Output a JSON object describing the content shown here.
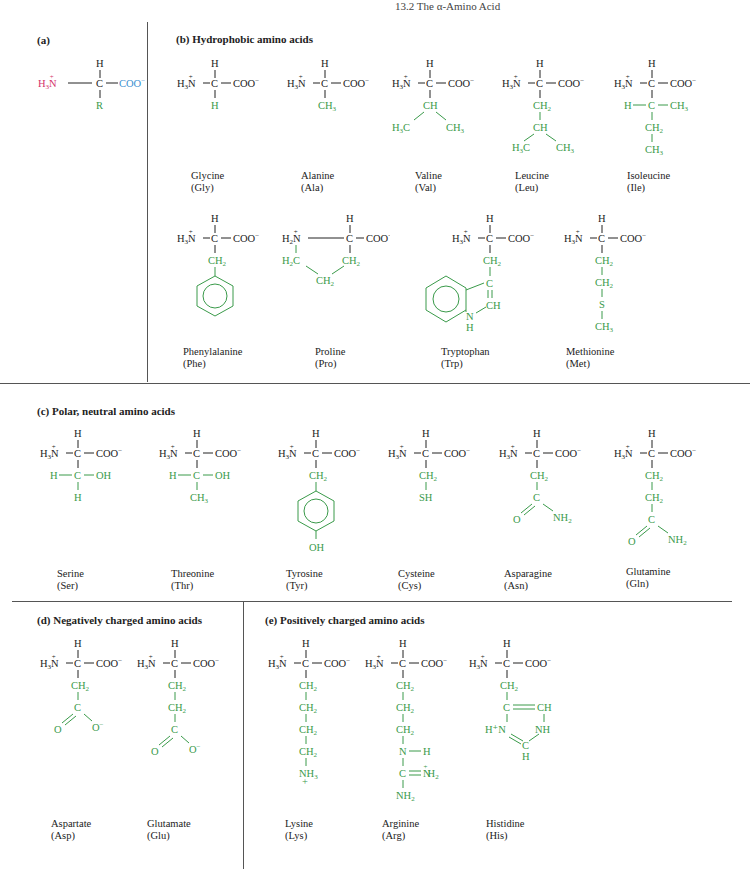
{
  "header": {
    "running_title": "13.2  The α-Amino Acid"
  },
  "sections": {
    "a": {
      "title": "(a)",
      "generic": {
        "amine": "H₃N̈⁺",
        "carbon": "C",
        "carboxyl": "COO⁻",
        "h": "H",
        "r": "R"
      }
    },
    "b": {
      "title": "(b) Hydrophobic amino acids"
    },
    "c": {
      "title": "(c) Polar, neutral amino acids"
    },
    "d": {
      "title": "(d) Negatively charged amino acids"
    },
    "e": {
      "title": "(e) Positively charged amino acids"
    }
  },
  "amino_acids": [
    {
      "name": "Glycine",
      "abbr": "(Gly)",
      "group": "b",
      "side_chain": "H"
    },
    {
      "name": "Alanine",
      "abbr": "(Ala)",
      "group": "b",
      "side_chain": "CH3"
    },
    {
      "name": "Valine",
      "abbr": "(Val)",
      "group": "b",
      "side_chain": "CH(CH3)2"
    },
    {
      "name": "Leucine",
      "abbr": "(Leu)",
      "group": "b",
      "side_chain": "CH2-CH(CH3)2"
    },
    {
      "name": "Isoleucine",
      "abbr": "(Ile)",
      "group": "b",
      "side_chain": "H-C-CH3, CH2, CH3"
    },
    {
      "name": "Phenylalanine",
      "abbr": "(Phe)",
      "group": "b",
      "side_chain": "CH2-phenyl"
    },
    {
      "name": "Proline",
      "abbr": "(Pro)",
      "group": "b",
      "side_chain": "H2C-CH2-CH2 ring"
    },
    {
      "name": "Tryptophan",
      "abbr": "(Trp)",
      "group": "b",
      "side_chain": "CH2-indole"
    },
    {
      "name": "Methionine",
      "abbr": "(Met)",
      "group": "b",
      "side_chain": "CH2-CH2-S-CH3"
    },
    {
      "name": "Serine",
      "abbr": "(Ser)",
      "group": "c",
      "side_chain": "H-C-OH, H"
    },
    {
      "name": "Threonine",
      "abbr": "(Thr)",
      "group": "c",
      "side_chain": "H-C-OH, CH3"
    },
    {
      "name": "Tyrosine",
      "abbr": "(Tyr)",
      "group": "c",
      "side_chain": "CH2-phenol-OH"
    },
    {
      "name": "Cysteine",
      "abbr": "(Cys)",
      "group": "c",
      "side_chain": "CH2-SH"
    },
    {
      "name": "Asparagine",
      "abbr": "(Asn)",
      "group": "c",
      "side_chain": "CH2-C(=O)NH2"
    },
    {
      "name": "Glutamine",
      "abbr": "(Gln)",
      "group": "c",
      "side_chain": "CH2-CH2-C(=O)NH2"
    },
    {
      "name": "Aspartate",
      "abbr": "(Asp)",
      "group": "d",
      "side_chain": "CH2-C(=O)O-"
    },
    {
      "name": "Glutamate",
      "abbr": "(Glu)",
      "group": "d",
      "side_chain": "CH2-CH2-C(=O)O-"
    },
    {
      "name": "Lysine",
      "abbr": "(Lys)",
      "group": "e",
      "side_chain": "(CH2)4-NH3+"
    },
    {
      "name": "Arginine",
      "abbr": "(Arg)",
      "group": "e",
      "side_chain": "(CH2)3-NH-C(=NH2+)NH2"
    },
    {
      "name": "Histidine",
      "abbr": "(His)",
      "group": "e",
      "side_chain": "CH2-imidazolium"
    }
  ],
  "colors": {
    "backbone": "#222222",
    "side_chain": "#3a9a4a",
    "amine": "#d4306a",
    "carboxyl": "#3a8fd0"
  }
}
